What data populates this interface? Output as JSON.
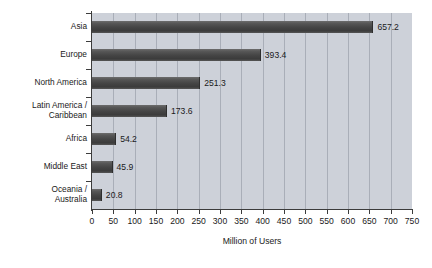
{
  "chart_data": {
    "type": "bar",
    "orientation": "horizontal",
    "title": "",
    "subtitle": "",
    "xlabel": "Million of Users",
    "ylabel": "",
    "xlim": [
      0,
      750
    ],
    "ylim": null,
    "xticks": [
      0,
      50,
      100,
      150,
      200,
      250,
      300,
      350,
      400,
      450,
      500,
      550,
      600,
      650,
      700,
      750
    ],
    "xtick_labels": [
      "0",
      "50",
      "100",
      "150",
      "200",
      "250",
      "300",
      "350",
      "400",
      "450",
      "500",
      "550",
      "600",
      "650",
      "700",
      "750"
    ],
    "grid": "vertical",
    "legend": null,
    "legend_position": "none",
    "categories": [
      "Asia",
      "Europe",
      "North America",
      "Latin America /\nCaribbean",
      "Africa",
      "Middle East",
      "Oceania /\nAustralia"
    ],
    "values": [
      657.2,
      393.4,
      251.3,
      173.6,
      54.2,
      45.9,
      20.8
    ],
    "data_labels": [
      "657.2",
      "393.4",
      "251.3",
      "173.6",
      "54.2",
      "45.9",
      "20.8"
    ],
    "data_label_position": "outside-end",
    "series": [
      {
        "name": "Million of Users",
        "values": [
          657.2,
          393.4,
          251.3,
          173.6,
          54.2,
          45.9,
          20.8
        ]
      }
    ],
    "colors": {
      "bar": "#484848",
      "plot_background": "#cdd1d9",
      "gridline": "#a9aeb8",
      "axis": "#3c3c3c",
      "text": "#1a1a1a",
      "page_background": "#ffffff"
    }
  }
}
